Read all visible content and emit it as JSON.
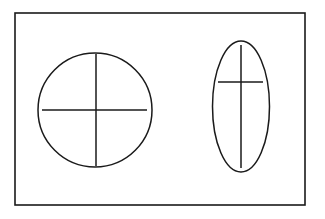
{
  "diagram": {
    "background": "#ffffff",
    "stroke_color": "#1a1a1a",
    "frame": {
      "x": 15,
      "y": 13,
      "width": 290,
      "height": 192,
      "stroke_width": 1.6
    },
    "shapes": [
      {
        "kind": "circle",
        "name": "circle-with-centered-cross",
        "cx": 95,
        "cy": 110,
        "r": 57,
        "stroke_width": 1.5,
        "cross": {
          "horizontal": {
            "x1": 42,
            "y1": 110,
            "x2": 147,
            "y2": 110
          },
          "vertical": {
            "x1": 96,
            "y1": 54,
            "x2": 96,
            "y2": 166
          }
        }
      },
      {
        "kind": "ellipse",
        "name": "ellipse-with-offset-cross",
        "cx": 241,
        "cy": 106.5,
        "rx": 28.5,
        "ry": 65.5,
        "stroke_width": 1.5,
        "cross": {
          "horizontal": {
            "x1": 218,
            "y1": 82,
            "x2": 263,
            "y2": 82
          },
          "vertical": {
            "x1": 241,
            "y1": 45,
            "x2": 241,
            "y2": 168
          }
        }
      }
    ]
  }
}
